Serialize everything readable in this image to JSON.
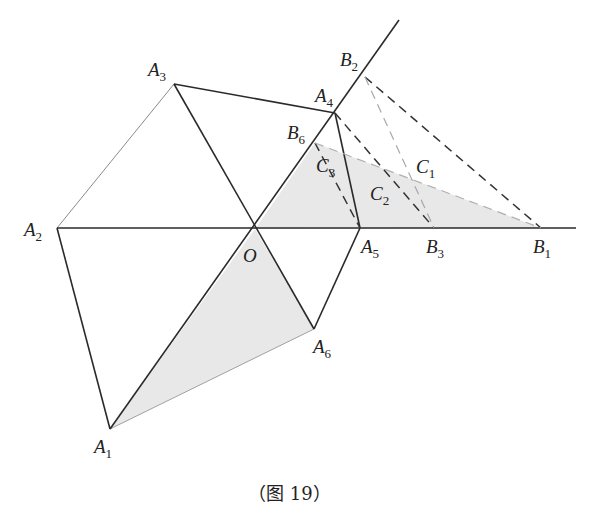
{
  "figure": {
    "caption": "（图 19）",
    "colors": {
      "stroke": "#2a2a2a",
      "light_stroke": "#9a9a9a",
      "shade": "#e6e6e6",
      "dash_dark": "#333333",
      "dash_light": "#a8a8a8"
    },
    "points": {
      "O": {
        "label": "O",
        "sub": "",
        "x": 255,
        "y": 229
      },
      "A1": {
        "label": "A",
        "sub": "1",
        "x": 110,
        "y": 429
      },
      "A2": {
        "label": "A",
        "sub": "2",
        "x": 57,
        "y": 228
      },
      "A3": {
        "label": "A",
        "sub": "3",
        "x": 174,
        "y": 84
      },
      "A4": {
        "label": "A",
        "sub": "4",
        "x": 335,
        "y": 113
      },
      "A5": {
        "label": "A",
        "sub": "5",
        "x": 360,
        "y": 228
      },
      "A6": {
        "label": "A",
        "sub": "6",
        "x": 314,
        "y": 329
      },
      "B1": {
        "label": "B",
        "sub": "1",
        "x": 541,
        "y": 228
      },
      "B2": {
        "label": "B",
        "sub": "2",
        "x": 365,
        "y": 77
      },
      "B3": {
        "label": "B",
        "sub": "3",
        "x": 434,
        "y": 228
      },
      "B6": {
        "label": "B",
        "sub": "6",
        "x": 315,
        "y": 143
      },
      "C1": {
        "label": "C",
        "sub": "1"
      },
      "C2": {
        "label": "C",
        "sub": "2"
      },
      "C3": {
        "label": "C",
        "sub": "3"
      }
    },
    "labels": {
      "A1": {
        "main": "A",
        "sub": "1"
      },
      "A2": {
        "main": "A",
        "sub": "2"
      },
      "A3": {
        "main": "A",
        "sub": "3"
      },
      "A4": {
        "main": "A",
        "sub": "4"
      },
      "A5": {
        "main": "A",
        "sub": "5"
      },
      "A6": {
        "main": "A",
        "sub": "6"
      },
      "B1": {
        "main": "B",
        "sub": "1"
      },
      "B2": {
        "main": "B",
        "sub": "2"
      },
      "B3": {
        "main": "B",
        "sub": "3"
      },
      "B6": {
        "main": "B",
        "sub": "6"
      },
      "C1": {
        "main": "C",
        "sub": "1"
      },
      "C2": {
        "main": "C",
        "sub": "2"
      },
      "C3": {
        "main": "C",
        "sub": "3"
      },
      "O": {
        "main": "O"
      }
    },
    "shaded_regions": [
      "triangle O-A1-A6",
      "triangle O-B6-B1"
    ],
    "solid_segments": [
      "A1-A2",
      "A2-A3",
      "A3-A4",
      "A4-A5",
      "A5-A6",
      "A2-B1 (ray)",
      "A1-B2 (ray)",
      "A3-A6",
      "A4-A5",
      "O-A6"
    ],
    "dashed_segments": [
      "A4-B3",
      "B2-B1",
      "B2-B3",
      "B6-A5",
      "B6-B1"
    ]
  }
}
